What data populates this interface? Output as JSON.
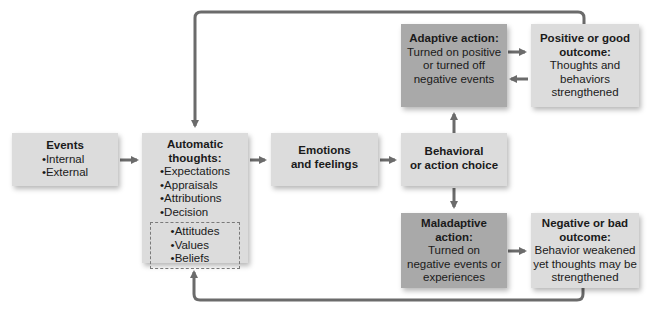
{
  "diagram": {
    "colors": {
      "light_box": "#dcdcdc",
      "dark_box": "#a9a9a9",
      "arrow": "#6b6b6b"
    },
    "events": {
      "title": "Events",
      "items": [
        "Internal",
        "External"
      ]
    },
    "automatic_thoughts": {
      "title_line1": "Automatic",
      "title_line2": "thoughts:",
      "items": [
        "Expectations",
        "Appraisals",
        "Attributions",
        "Decision"
      ],
      "dashed_items": [
        "Attitudes",
        "Values",
        "Beliefs"
      ]
    },
    "emotions": {
      "line1": "Emotions",
      "line2": "and feelings"
    },
    "behavioral": {
      "line1": "Behavioral",
      "line2": "or action choice"
    },
    "adaptive": {
      "title": "Adaptive action:",
      "line1": "Turned on positive",
      "line2": "or turned off",
      "line3": "negative events"
    },
    "positive": {
      "title_line1": "Positive or good",
      "title_line2": "outcome:",
      "line1": "Thoughts and",
      "line2": "behaviors",
      "line3": "strengthened"
    },
    "maladaptive": {
      "title_line1": "Maladaptive",
      "title_line2": "action:",
      "line1": "Turned on",
      "line2": "negative events or",
      "line3": "experiences"
    },
    "negative": {
      "title_line1": "Negative or bad",
      "title_line2": "outcome:",
      "line1": "Behavior weakened",
      "line2": "yet thoughts may be",
      "line3": "strengthened"
    }
  }
}
